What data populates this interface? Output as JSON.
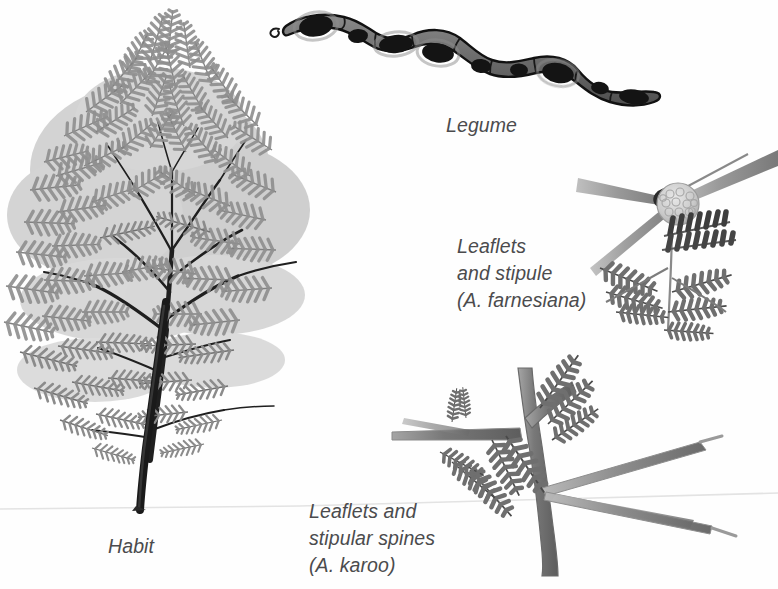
{
  "plate": {
    "title": "Acacia botanical illustration plate",
    "medium": "pencil / graphite grayscale drawing",
    "background_color": "#fefefe",
    "label_color": "#4b4b4d",
    "ground_line_color": "#e2e2e2"
  },
  "labels": {
    "legume": "Legume",
    "habit": "Habit",
    "farnesiana_line1": "Leaflets",
    "farnesiana_line2": "and stipule",
    "farnesiana_line3": "(A. farnesiana)",
    "karoo_line1": "Leaflets and",
    "karoo_line2": "stipular spines",
    "karoo_line3": "(A. karoo)"
  },
  "figures": {
    "habit": {
      "name": "Acacia tree habit",
      "description": "Full tree with spreading feathery canopy and slender dark curving trunk",
      "canopy_color": "#8d8d8d",
      "trunk_color": "#1d1d1d",
      "trunk_base_x": 140,
      "trunk_base_y": 510
    },
    "legume": {
      "name": "Legume pod",
      "description": "Elongated constricted seed pod with seven segments, each containing a dark oval seed",
      "segments": 7,
      "pod_fill": "#6e6e6e",
      "seed_color": "#141414",
      "outline_color": "#111111"
    },
    "farnesiana_detail": {
      "name": "Leaflets and stipule of Acacia farnesiana",
      "description": "Globose pale flower head with radiating stipules and bipinnate leaflets",
      "flowerhead_color": "#cfcfcf",
      "leaflet_color": "#6a6a6a"
    },
    "karoo_detail": {
      "name": "Leaflets and stipular spines of Acacia karoo",
      "description": "Vertical stem bearing paired long straight stipular spines and bipinnate leaflets",
      "spine_color": "#9a9a9a",
      "stem_color": "#7a7a7a",
      "leaflet_color": "#737373"
    }
  }
}
